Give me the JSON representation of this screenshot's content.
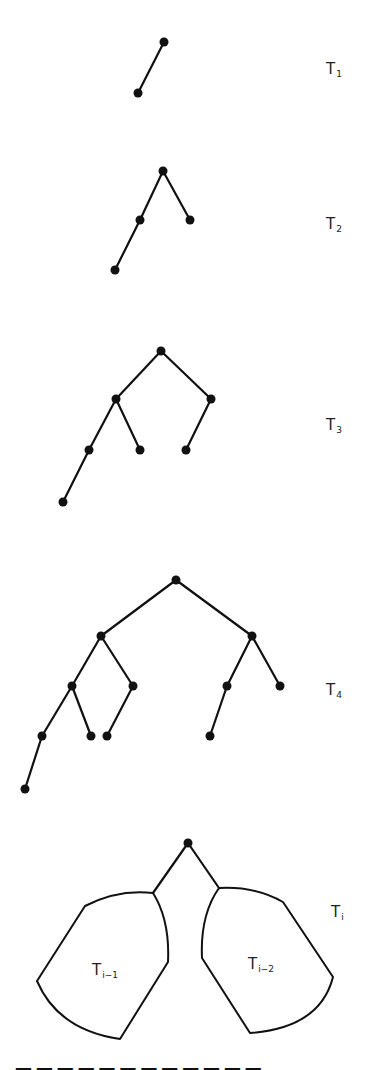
{
  "figure": {
    "trees": [
      {
        "id": "T1",
        "label": "T",
        "subscript": "1",
        "nodes": [
          [
            164,
            42
          ],
          [
            138,
            93
          ]
        ],
        "edges": [
          [
            0,
            1
          ]
        ]
      },
      {
        "id": "T2",
        "label": "T",
        "subscript": "2",
        "nodes": [
          [
            163,
            171
          ],
          [
            140,
            220
          ],
          [
            190,
            220
          ],
          [
            115,
            270
          ]
        ],
        "edges": [
          [
            0,
            1
          ],
          [
            0,
            2
          ],
          [
            1,
            3
          ]
        ]
      },
      {
        "id": "T3",
        "label": "T",
        "subscript": "3",
        "nodes": [
          [
            161,
            351
          ],
          [
            116,
            399
          ],
          [
            211,
            399
          ],
          [
            89,
            450
          ],
          [
            140,
            450
          ],
          [
            186,
            450
          ],
          [
            63,
            502
          ]
        ],
        "edges": [
          [
            0,
            1
          ],
          [
            0,
            2
          ],
          [
            1,
            3
          ],
          [
            1,
            4
          ],
          [
            2,
            5
          ],
          [
            3,
            6
          ]
        ]
      },
      {
        "id": "T4",
        "label": "T",
        "subscript": "4",
        "nodes": [
          [
            176,
            580
          ],
          [
            101,
            636
          ],
          [
            252,
            636
          ],
          [
            72,
            686
          ],
          [
            133,
            686
          ],
          [
            227,
            686
          ],
          [
            280,
            686
          ],
          [
            42,
            736
          ],
          [
            91,
            736
          ],
          [
            107,
            736
          ],
          [
            210,
            736
          ],
          [
            25,
            789
          ]
        ],
        "edges": [
          [
            0,
            1
          ],
          [
            0,
            2
          ],
          [
            1,
            3
          ],
          [
            1,
            4
          ],
          [
            2,
            5
          ],
          [
            2,
            6
          ],
          [
            3,
            7
          ],
          [
            3,
            8
          ],
          [
            4,
            9
          ],
          [
            5,
            10
          ],
          [
            7,
            11
          ]
        ]
      }
    ],
    "general": {
      "id": "Ti",
      "label": "T",
      "subscript": "i",
      "left_subtree": {
        "label": "T",
        "subscript": "i−1"
      },
      "right_subtree": {
        "label": "T",
        "subscript": "i−2"
      }
    },
    "caption_partial": "(caption cut off at bottom edge)"
  }
}
